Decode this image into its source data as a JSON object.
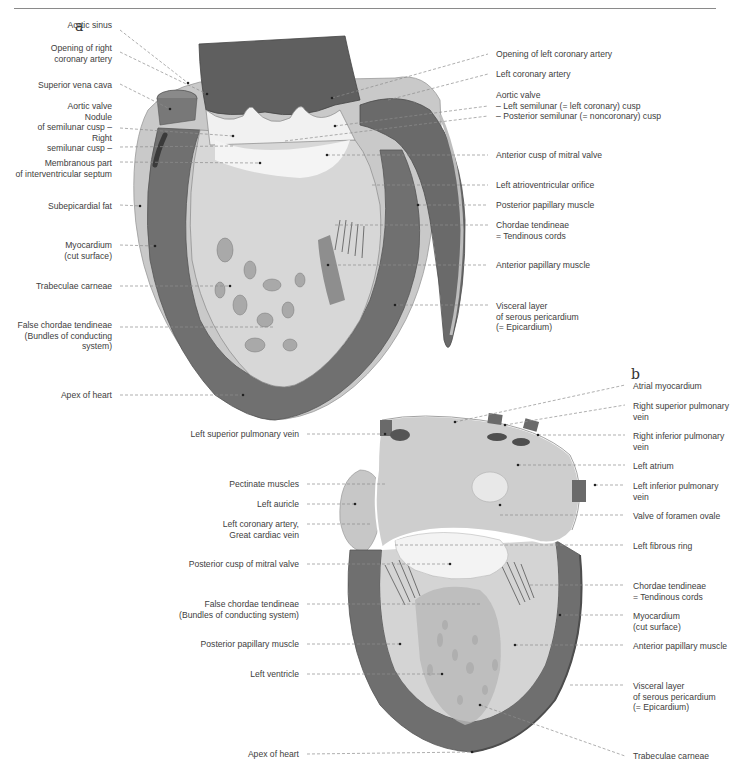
{
  "figure": {
    "panels": [
      {
        "letter": "a",
        "labels_left": [
          {
            "text": "Aortic sinus",
            "x": 112,
            "y": 26
          },
          {
            "text": "Opening of right\ncoronary artery",
            "x": 112,
            "y": 48
          },
          {
            "text": "Superior vena cava",
            "x": 112,
            "y": 80
          },
          {
            "text": "Aortic valve\nNodule\nof semilunar cusp –\nRight\nsemilunar cusp –",
            "x": 112,
            "y": 100
          },
          {
            "text": "Membranous part\nof interventricular septum",
            "x": 112,
            "y": 158
          },
          {
            "text": "Subepicardial fat",
            "x": 112,
            "y": 201
          },
          {
            "text": "Myocardium\n(cut surface)",
            "x": 112,
            "y": 240
          },
          {
            "text": "Trabeculae carneae",
            "x": 112,
            "y": 281
          },
          {
            "text": "False chordae tendineae\n(Bundles of conducting\nsystem)",
            "x": 112,
            "y": 317
          },
          {
            "text": "Apex of heart",
            "x": 112,
            "y": 391
          }
        ],
        "labels_right": [
          {
            "text": "Opening of left coronary artery",
            "x": 496,
            "y": 50
          },
          {
            "text": "Left coronary artery",
            "x": 496,
            "y": 70
          },
          {
            "text": "Aortic valve\n– Left semilunar (= left coronary) cusp\n– Posterior semilunar (= noncoronary) cusp",
            "x": 496,
            "y": 89
          },
          {
            "text": "Anterior cusp of mitral valve",
            "x": 496,
            "y": 150
          },
          {
            "text": "Left atrioventricular orifice",
            "x": 496,
            "y": 180
          },
          {
            "text": "Posterior papillary muscle",
            "x": 496,
            "y": 200
          },
          {
            "text": "Chordae tendineae\n= Tendinous cords",
            "x": 496,
            "y": 219
          },
          {
            "text": "Anterior papillary muscle",
            "x": 496,
            "y": 259
          },
          {
            "text": "Visceral layer\nof serous pericardium\n(= Epicardium)",
            "x": 496,
            "y": 301
          }
        ]
      },
      {
        "letter": "b",
        "labels_left": [
          {
            "text": "Left superior pulmonary vein",
            "x": 299,
            "y": 430
          },
          {
            "text": "Pectinate muscles",
            "x": 299,
            "y": 480
          },
          {
            "text": "Left auricle",
            "x": 299,
            "y": 500
          },
          {
            "text": "Left coronary artery,\nGreat cardiac vein",
            "x": 299,
            "y": 520
          },
          {
            "text": "Posterior cusp of mitral valve",
            "x": 299,
            "y": 560
          },
          {
            "text": "False chordae tendineae\n(Bundles of conducting system)",
            "x": 299,
            "y": 599
          },
          {
            "text": "Posterior papillary muscle",
            "x": 299,
            "y": 640
          },
          {
            "text": "Left ventricle",
            "x": 299,
            "y": 670
          },
          {
            "text": "Apex of heart",
            "x": 299,
            "y": 750
          }
        ],
        "labels_right": [
          {
            "text": "Atrial myocardium",
            "x": 633,
            "y": 382
          },
          {
            "text": "Right superior pulmonary\nvein",
            "x": 633,
            "y": 401
          },
          {
            "text": "Right inferior pulmonary\nvein",
            "x": 633,
            "y": 431
          },
          {
            "text": "Left atrium",
            "x": 633,
            "y": 461
          },
          {
            "text": "Left inferior pulmonary\nvein",
            "x": 633,
            "y": 481
          },
          {
            "text": "Valve of foramen ovale",
            "x": 633,
            "y": 511
          },
          {
            "text": "Left fibrous ring",
            "x": 633,
            "y": 541
          },
          {
            "text": "Chordae tendineae\n= Tendinous cords",
            "x": 633,
            "y": 581
          },
          {
            "text": "Myocardium\n(cut surface)",
            "x": 633,
            "y": 611
          },
          {
            "text": "Anterior papillary muscle",
            "x": 633,
            "y": 642
          },
          {
            "text": "Visceral layer\nof serous pericardium\n(= Epicardium)",
            "x": 633,
            "y": 682
          },
          {
            "text": "Trabeculae carneae",
            "x": 633,
            "y": 752
          }
        ]
      }
    ],
    "colors": {
      "myocardium": "#6f6f6f",
      "myocardium_dark": "#585858",
      "endocardium": "#d9d9d9",
      "fat": "#c9c9c9",
      "valve": "#f2f2f2",
      "leader": "#8c8c8c",
      "text": "#404040"
    }
  }
}
